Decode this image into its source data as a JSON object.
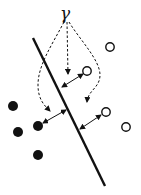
{
  "diagram": {
    "margin_symbol": "γ",
    "colors": {
      "ink": "#111111",
      "background": "#ffffff"
    },
    "hyperplane": {
      "x1": 33,
      "y1": 38,
      "x2": 105,
      "y2": 186
    },
    "positive_points_open": [
      {
        "x": 110,
        "y": 47
      },
      {
        "x": 87,
        "y": 71
      },
      {
        "x": 106,
        "y": 112
      },
      {
        "x": 126,
        "y": 127
      }
    ],
    "negative_points_filled": [
      {
        "x": 13,
        "y": 106
      },
      {
        "x": 38,
        "y": 126
      },
      {
        "x": 18,
        "y": 132
      },
      {
        "x": 38,
        "y": 155
      }
    ],
    "margin_arrows": [
      {
        "from": [
          62,
          87
        ],
        "to": [
          84,
          74
        ]
      },
      {
        "from": [
          80,
          129
        ],
        "to": [
          102,
          114
        ]
      },
      {
        "from": [
          66,
          110
        ],
        "to": [
          42,
          124
        ]
      }
    ]
  }
}
